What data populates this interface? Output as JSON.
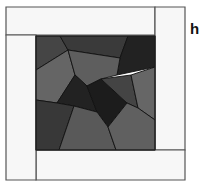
{
  "figure": {
    "label": "h"
  },
  "colors": {
    "strip_fill": "#f7f7f7",
    "strip_stroke": "#555555",
    "piece_stroke": "#111111",
    "shade_darkest": "#1e1e1e",
    "shade_very_dark": "#262626",
    "shade_dark": "#3c3c3c",
    "shade_dark_medium": "#4a4a4a",
    "shade_medium": "#5c5c5c",
    "shade_medium_light": "#666666"
  },
  "strips": [
    {
      "name": "top-strip",
      "points": "6,7 155,7 155,35 6,35"
    },
    {
      "name": "right-strip",
      "points": "155,7 185,7 185,150 155,150"
    },
    {
      "name": "bottom-strip",
      "points": "36,150 185,150 185,180 36,180"
    },
    {
      "name": "left-strip",
      "points": "6,35 36,35 36,180 6,180"
    }
  ],
  "pieces": [
    {
      "name": "piece-top-left",
      "points": "36,36 60,36 68,50 36,70",
      "shade": "#454545"
    },
    {
      "name": "piece-top-middle",
      "points": "60,36 128,36 120,58 68,50",
      "shade": "#3a3a3a"
    },
    {
      "name": "piece-top-right",
      "points": "128,36 155,36 155,67 117,75 120,58",
      "shade": "#222222"
    },
    {
      "name": "piece-left-middle",
      "points": "36,70 68,50 75,75 57,103 36,100",
      "shade": "#656565"
    },
    {
      "name": "piece-center-upper",
      "points": "68,50 120,58 117,75 101,79 87,86 75,75",
      "shade": "#5e5e5e"
    },
    {
      "name": "piece-center-dark-left",
      "points": "75,75 87,86 97,112 74,106 57,103",
      "shade": "#222222"
    },
    {
      "name": "piece-center-dark-right",
      "points": "87,86 101,79 127,103 108,127 97,112",
      "shade": "#1c1c1c"
    },
    {
      "name": "piece-right-small",
      "points": "101,79 131,75 138,108 127,103",
      "shade": "#444444"
    },
    {
      "name": "piece-right",
      "points": "131,75 155,67 155,120 138,108",
      "shade": "#666666"
    },
    {
      "name": "piece-bottom-left",
      "points": "36,100 57,103 74,106 59,150 36,150",
      "shade": "#383838"
    },
    {
      "name": "piece-bottom-middle",
      "points": "74,106 97,112 108,127 116,150 59,150",
      "shade": "#595959"
    },
    {
      "name": "piece-bottom-right",
      "points": "108,127 127,103 138,108 155,120 155,150 116,150",
      "shade": "#606060"
    }
  ]
}
